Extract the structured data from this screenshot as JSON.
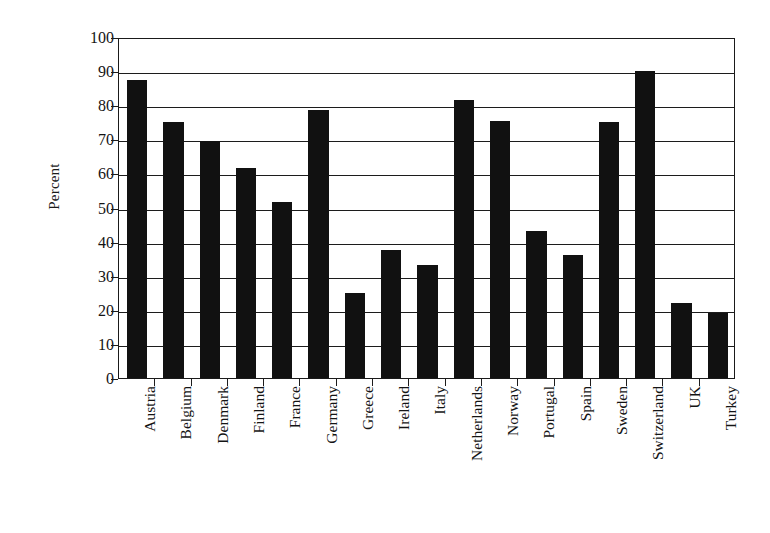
{
  "chart_data": {
    "type": "bar",
    "title": "",
    "subtitle": "",
    "xlabel": "",
    "ylabel": "Percent",
    "ylim": [
      0,
      100
    ],
    "ytick_step": 10,
    "yticks": [
      100,
      90,
      80,
      70,
      60,
      50,
      40,
      30,
      20,
      10,
      0
    ],
    "grid": "horizontal",
    "legend": "none",
    "bar_color": "#111111",
    "axis_color": "#1a1a1a",
    "categories": [
      "Austria",
      "Belgium",
      "Denmark",
      "Finland",
      "France",
      "Germany",
      "Greece",
      "Ireland",
      "Italy",
      "Netherlands",
      "Norway",
      "Portugal",
      "Spain",
      "Sweden",
      "Switzerland",
      "UK",
      "Turkey"
    ],
    "values": [
      87.5,
      75,
      69.5,
      61.5,
      51.5,
      78.5,
      25,
      37.5,
      33,
      81.5,
      75.5,
      43,
      36,
      75,
      90,
      22,
      19
    ]
  }
}
